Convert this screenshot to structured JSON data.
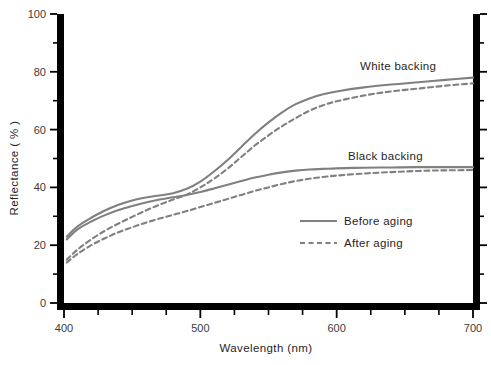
{
  "chart_data": {
    "type": "line",
    "title": "",
    "xlabel": "Wavelength (nm)",
    "ylabel": "Reflectance ( % )",
    "xlim": [
      400,
      700
    ],
    "ylim": [
      0,
      100
    ],
    "xticks": [
      400,
      500,
      600,
      700
    ],
    "xtick_labels": [
      "400",
      "500",
      "600",
      "700"
    ],
    "xminor_step": 25,
    "yticks": [
      0,
      20,
      40,
      60,
      80,
      100
    ],
    "ytick_labels": [
      "0",
      "20",
      "40",
      "60",
      "80",
      "100"
    ],
    "yminor_step": 10,
    "grid": false,
    "legend_position": "center-right-inside",
    "series_color": "#808080",
    "axis_color": "#000000",
    "series": [
      {
        "name": "White backing – Before aging",
        "group": "White backing",
        "style": "solid",
        "x": [
          402,
          410,
          420,
          430,
          440,
          450,
          460,
          470,
          480,
          490,
          500,
          510,
          520,
          530,
          540,
          550,
          560,
          570,
          580,
          590,
          600,
          620,
          640,
          660,
          680,
          700
        ],
        "values": [
          23.0,
          26.5,
          29.5,
          32.0,
          34.0,
          35.5,
          36.5,
          37.2,
          38.0,
          39.5,
          42.0,
          45.5,
          49.5,
          54.0,
          58.5,
          62.5,
          66.0,
          68.8,
          70.8,
          72.2,
          73.2,
          74.6,
          75.6,
          76.4,
          77.2,
          78.0
        ]
      },
      {
        "name": "White backing – After aging",
        "group": "White backing",
        "style": "dashed",
        "x": [
          402,
          410,
          420,
          430,
          440,
          450,
          460,
          470,
          480,
          490,
          500,
          510,
          520,
          530,
          540,
          550,
          560,
          570,
          580,
          590,
          600,
          620,
          640,
          660,
          680,
          700
        ],
        "values": [
          15.0,
          18.5,
          22.0,
          25.0,
          27.5,
          29.8,
          32.0,
          34.0,
          35.8,
          37.5,
          40.0,
          43.0,
          46.5,
          50.5,
          54.5,
          58.0,
          61.2,
          64.0,
          66.5,
          68.4,
          69.8,
          71.8,
          73.2,
          74.2,
          75.2,
          76.0
        ]
      },
      {
        "name": "Black backing – Before aging",
        "group": "Black backing",
        "style": "solid",
        "x": [
          402,
          410,
          420,
          430,
          440,
          450,
          460,
          470,
          480,
          490,
          500,
          510,
          520,
          530,
          540,
          550,
          560,
          570,
          580,
          590,
          600,
          620,
          640,
          660,
          680,
          700
        ],
        "values": [
          22.0,
          25.5,
          28.2,
          30.4,
          32.2,
          33.6,
          34.8,
          35.8,
          36.6,
          37.4,
          38.4,
          39.6,
          40.9,
          42.2,
          43.4,
          44.4,
          45.2,
          45.8,
          46.2,
          46.4,
          46.6,
          46.8,
          46.9,
          47.0,
          47.0,
          47.0
        ]
      },
      {
        "name": "Black backing – After aging",
        "group": "Black backing",
        "style": "dashed",
        "x": [
          402,
          410,
          420,
          430,
          440,
          450,
          460,
          470,
          480,
          490,
          500,
          510,
          520,
          530,
          540,
          550,
          560,
          570,
          580,
          590,
          600,
          620,
          640,
          660,
          680,
          700
        ],
        "values": [
          14.0,
          17.0,
          20.0,
          22.4,
          24.5,
          26.2,
          27.8,
          29.2,
          30.5,
          31.8,
          33.2,
          34.6,
          36.0,
          37.4,
          38.8,
          40.0,
          41.2,
          42.2,
          43.0,
          43.6,
          44.1,
          44.8,
          45.3,
          45.7,
          45.9,
          46.0
        ]
      }
    ],
    "annotations": [
      {
        "id": "white-backing",
        "text": "White backing",
        "x_px": 360,
        "y_px": 70
      },
      {
        "id": "black-backing",
        "text": "Black backing",
        "x_px": 348,
        "y_px": 160
      }
    ],
    "legend_entries": [
      {
        "id": "before-aging",
        "label": "Before aging",
        "style": "solid"
      },
      {
        "id": "after-aging",
        "label": "After aging",
        "style": "dashed"
      }
    ]
  }
}
